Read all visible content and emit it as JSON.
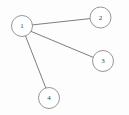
{
  "figure": {
    "title": "",
    "background_color": "#fdfdfd",
    "width": 129,
    "height": 115
  },
  "chart_data": {
    "type": "diagram",
    "diagram_kind": "node-link-graph",
    "title": "",
    "directed": false,
    "node_radius": 10.5,
    "node_fill": "#ffffff",
    "node_stroke": "#8a8a8a",
    "edge_stroke": "#6e6e6e",
    "nodes": [
      {
        "id": "1",
        "label": "1",
        "x": 22,
        "y": 26
      },
      {
        "id": "2",
        "label": "2",
        "x": 100.5,
        "y": 17.5
      },
      {
        "id": "3",
        "label": "3",
        "x": 103,
        "y": 61
      },
      {
        "id": "4",
        "label": "4",
        "x": 49,
        "y": 98
      }
    ],
    "edges": [
      {
        "source": "1",
        "target": "2",
        "x1": 32.4,
        "y1": 24.9,
        "x2": 90.1,
        "y2": 18.6
      },
      {
        "source": "1",
        "target": "3",
        "x1": 31.3,
        "y1": 31.5,
        "x2": 93.0,
        "y2": 57.3
      },
      {
        "source": "1",
        "target": "4",
        "x1": 25.6,
        "y1": 36.2,
        "x2": 45.8,
        "y2": 87.9
      }
    ],
    "degrees": {
      "1": 3,
      "2": 1,
      "3": 1,
      "4": 1
    },
    "node_count": 4,
    "edge_count": 3
  }
}
